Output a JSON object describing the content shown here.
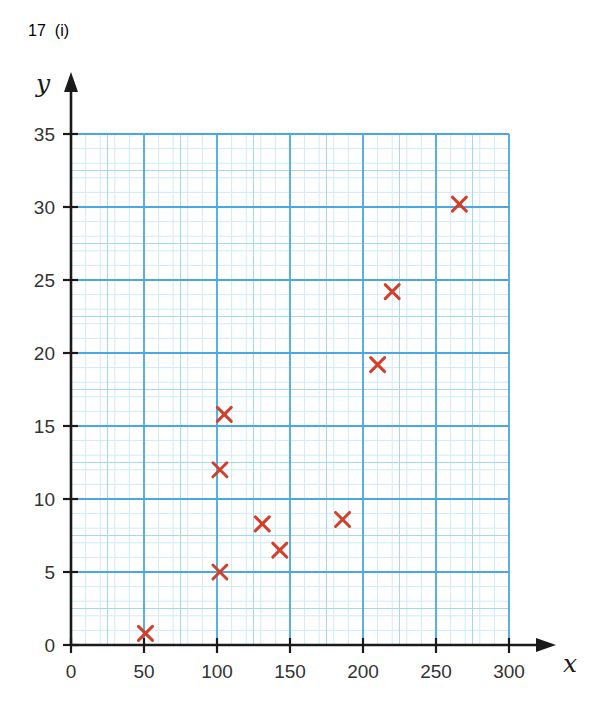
{
  "header": {
    "question_number": "17",
    "question_part": "(i)"
  },
  "colors": {
    "question_number": "#1f4e79",
    "question_part": "#4a7fae",
    "grid_fine": "#cfeaf7",
    "grid_medium": "#a5d8ef",
    "grid_major": "#4aa8de",
    "axis": "#1a1a1a",
    "marker": "#d1402a",
    "tick_label": "#333333"
  },
  "chart_data": {
    "type": "scatter",
    "title": "",
    "xlabel": "x",
    "ylabel": "y",
    "xlim": [
      0,
      300
    ],
    "ylim": [
      0,
      35
    ],
    "x_ticks": [
      0,
      50,
      100,
      150,
      200,
      250,
      300
    ],
    "y_ticks": [
      0,
      5,
      10,
      15,
      20,
      25,
      30,
      35
    ],
    "x_tick_labels": [
      "0",
      "50",
      "100",
      "150",
      "200",
      "250",
      "300"
    ],
    "y_tick_labels": [
      "0",
      "5",
      "10",
      "15",
      "20",
      "25",
      "30",
      "35"
    ],
    "grid": true,
    "grid_minor_step_x": 10,
    "grid_minor_step_y": 1,
    "grid_major_step_x": 50,
    "grid_major_step_y": 5,
    "legend": false,
    "marker": "x",
    "marker_color": "#d1402a",
    "points": [
      {
        "x": 51,
        "y": 0.8
      },
      {
        "x": 102,
        "y": 5.0
      },
      {
        "x": 102,
        "y": 12.0
      },
      {
        "x": 105,
        "y": 15.8
      },
      {
        "x": 131,
        "y": 8.3
      },
      {
        "x": 143,
        "y": 6.5
      },
      {
        "x": 186,
        "y": 8.6
      },
      {
        "x": 210,
        "y": 19.2
      },
      {
        "x": 220,
        "y": 24.2
      },
      {
        "x": 266,
        "y": 30.2
      }
    ]
  }
}
